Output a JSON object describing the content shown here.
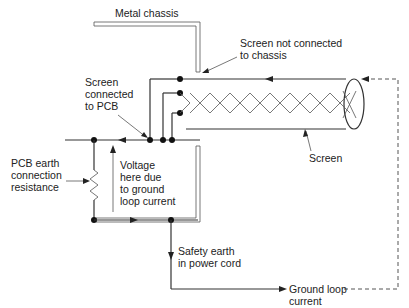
{
  "diagram": {
    "labels": {
      "metal_chassis": "Metal chassis",
      "screen_not_connected_1": "Screen not connected",
      "screen_not_connected_2": "to chassis",
      "screen_connected_1": "Screen",
      "screen_connected_2": "connected",
      "screen_connected_3": "to PCB",
      "screen": "Screen",
      "pcb_earth_1": "PCB earth",
      "pcb_earth_2": "connection",
      "pcb_earth_3": "resistance",
      "voltage_1": "Voltage",
      "voltage_2": "here due",
      "voltage_3": "to ground",
      "voltage_4": "loop current",
      "safety_earth_1": "Safety earth",
      "safety_earth_2": "in power cord",
      "ground_loop_1": "Ground loop",
      "ground_loop_2": "current"
    },
    "colors": {
      "line": "#333333",
      "background": "#ffffff"
    }
  }
}
